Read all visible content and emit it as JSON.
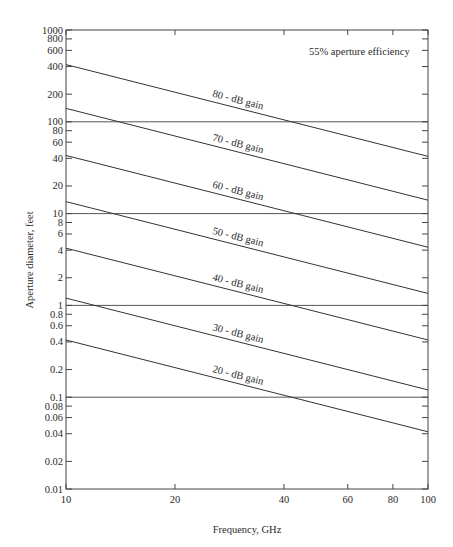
{
  "chart_data": {
    "type": "line",
    "title": "",
    "annotation": "55% aperture efficiency",
    "xlabel": "Frequency, GHz",
    "ylabel": "Aperture diameter, feet",
    "xscale": "log",
    "yscale": "log",
    "xlim": [
      10,
      100
    ],
    "ylim": [
      0.01,
      1000
    ],
    "grid": false,
    "x_ticks": [
      10,
      20,
      40,
      60,
      80,
      100
    ],
    "x_tick_labels": [
      "10",
      "20",
      "40",
      "60",
      "80",
      "100"
    ],
    "y_ticks": [
      0.01,
      0.02,
      0.04,
      0.06,
      0.08,
      0.1,
      0.2,
      0.4,
      0.6,
      0.8,
      1,
      2,
      4,
      6,
      8,
      10,
      20,
      40,
      60,
      80,
      100,
      200,
      400,
      600,
      800,
      1000
    ],
    "y_tick_labels": [
      "0.01",
      "0.02",
      "0.04",
      "0.06",
      "0.08",
      "0.1",
      "0.2",
      "0.4",
      "0.6",
      "0.8",
      "1",
      "2",
      "4",
      "6",
      "8",
      "10",
      "20",
      "40",
      "60",
      "80",
      "100",
      "200",
      "400",
      "600",
      "800",
      "1000"
    ],
    "reference_lines_y": [
      100,
      10,
      1,
      0.1
    ],
    "series": [
      {
        "name": "80-dB gain",
        "x": [
          10,
          100
        ],
        "values": [
          420,
          42
        ]
      },
      {
        "name": "70-dB gain",
        "x": [
          10,
          100
        ],
        "values": [
          140,
          14
        ]
      },
      {
        "name": "60-dB gain",
        "x": [
          10,
          100
        ],
        "values": [
          43,
          4.3
        ]
      },
      {
        "name": "50-dB gain",
        "x": [
          10,
          100
        ],
        "values": [
          13.5,
          1.35
        ]
      },
      {
        "name": "40-dB gain",
        "x": [
          10,
          100
        ],
        "values": [
          4.2,
          0.42
        ]
      },
      {
        "name": "30-dB gain",
        "x": [
          10,
          100
        ],
        "values": [
          1.2,
          0.12
        ]
      },
      {
        "name": "20-dB gain",
        "x": [
          10,
          100
        ],
        "values": [
          0.42,
          0.042
        ]
      }
    ]
  }
}
